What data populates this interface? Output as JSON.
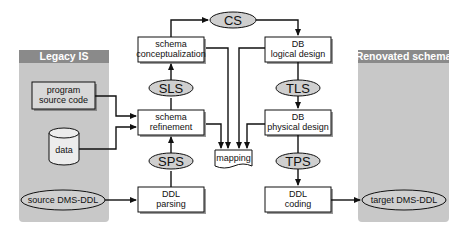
{
  "panels": {
    "legacy": {
      "title": "Legacy IS"
    },
    "renovated": {
      "title": "Renovated schema"
    }
  },
  "legacy_items": {
    "program": [
      "program",
      "source code"
    ],
    "data": "data",
    "source_ddl": "source DMS-DDL"
  },
  "target_ddl": "target DMS-DDL",
  "left_column": {
    "conceptualization": [
      "schema",
      "conceptualization"
    ],
    "sls": "SLS",
    "refinement": [
      "schema",
      "refinement"
    ],
    "sps": "SPS",
    "parsing": [
      "DDL",
      "parsing"
    ]
  },
  "right_column": {
    "logical": [
      "DB",
      "logical design"
    ],
    "tls": "TLS",
    "physical": [
      "DB",
      "physical design"
    ],
    "tps": "TPS",
    "coding": [
      "DDL",
      "coding"
    ]
  },
  "cs": "CS",
  "mapping": "mapping",
  "colors": {
    "panel_fill": "#c8c8c8",
    "panel_header": "#8a8a8a",
    "ellipse_fill": "#cfcfcf",
    "box_fill": "#ffffff",
    "line": "#111111"
  }
}
